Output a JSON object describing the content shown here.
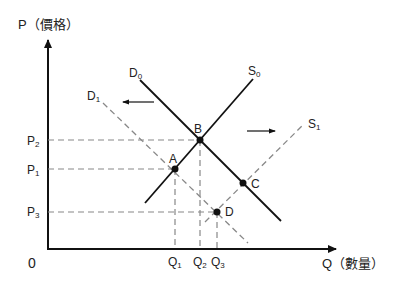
{
  "axes": {
    "y_label": "P（價格）",
    "x_label": "Q（數量）",
    "origin": "0"
  },
  "curves": {
    "D0": {
      "letter": "D",
      "sub": "0",
      "style": "solid"
    },
    "S0": {
      "letter": "S",
      "sub": "0",
      "style": "solid"
    },
    "D1": {
      "letter": "D",
      "sub": "1",
      "style": "dashed"
    },
    "S1": {
      "letter": "S",
      "sub": "1",
      "style": "dashed"
    }
  },
  "points": {
    "A": "A",
    "B": "B",
    "C": "C",
    "D": "D"
  },
  "price_ticks": [
    {
      "letter": "P",
      "sub": "2"
    },
    {
      "letter": "P",
      "sub": "1"
    },
    {
      "letter": "P",
      "sub": "3"
    }
  ],
  "quantity_ticks": [
    {
      "letter": "Q",
      "sub": "1"
    },
    {
      "letter": "Q",
      "sub": "2"
    },
    {
      "letter": "Q",
      "sub": "3"
    }
  ],
  "shifts": {
    "demand": "left",
    "supply": "right"
  },
  "colors": {
    "solid_line": "#111111",
    "dashed_line": "#888888",
    "axis": "#111111"
  }
}
